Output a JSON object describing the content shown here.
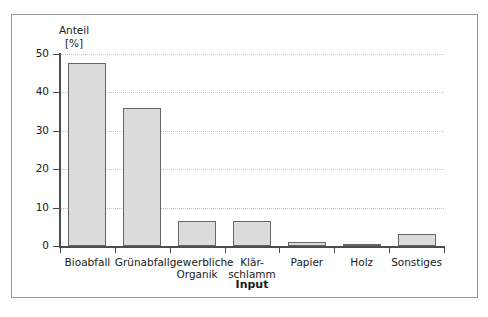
{
  "chart_data": {
    "type": "bar",
    "title": "",
    "xlabel": "Input",
    "ylabel": "Anteil\n[%]",
    "ylabel_name": "Anteil",
    "ylabel_unit": "[%]",
    "categories": [
      "Bioabfall",
      "Grünabfall",
      "gewerbliche\nOrganik",
      "Klär-\nschlamm",
      "Papier",
      "Holz",
      "Sonstiges"
    ],
    "values": [
      47.6,
      35.9,
      6.5,
      6.5,
      1.0,
      0.6,
      3.0
    ],
    "ylim": [
      0,
      50
    ],
    "yticks": [
      0,
      10,
      20,
      30,
      40,
      50
    ],
    "ytick_labels": [
      "0",
      "10",
      "20",
      "30",
      "40",
      "50"
    ],
    "grid": "horizontal-dotted",
    "legend": "none",
    "bar_fill": "#dcdcdc",
    "bar_edge": "#666666",
    "axis_color": "#4d4d4d",
    "grid_color": "#c4c4c4",
    "frame_color": "#9a9a9a",
    "background": "#ffffff"
  }
}
